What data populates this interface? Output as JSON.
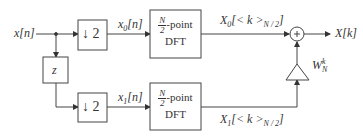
{
  "diagram": {
    "input_label": "x[n]",
    "output_label": "X[k]",
    "delay_label": "z",
    "downsample_top": "↓ 2",
    "downsample_bottom": "↓ 2",
    "signal_top": {
      "base": "x",
      "sub": "0",
      "arg": "[n]"
    },
    "signal_bottom": {
      "base": "x",
      "sub": "1",
      "arg": "[n]"
    },
    "dft_top": {
      "num": "N",
      "den": "2",
      "suffix": "-point",
      "line2": "DFT"
    },
    "dft_bottom": {
      "num": "N",
      "den": "2",
      "suffix": "-point",
      "line2": "DFT"
    },
    "output_top": {
      "base": "X",
      "sub": "0",
      "arg": "[< k >",
      "mod": "N / 2",
      "close": "]"
    },
    "output_bottom": {
      "base": "X",
      "sub": "1",
      "arg": "[< k >",
      "mod": "N / 2",
      "close": "]"
    },
    "twiddle": {
      "base": "W",
      "sub": "N",
      "sup": "k"
    },
    "sum_symbol": "+"
  }
}
